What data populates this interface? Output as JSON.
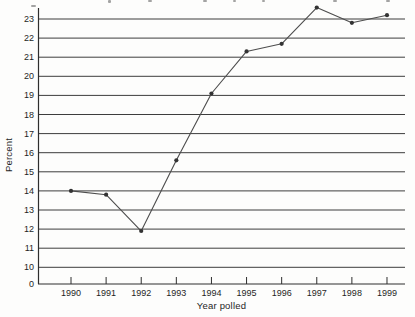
{
  "chart_data": {
    "type": "line",
    "title": "",
    "xlabel": "Year polled",
    "ylabel": "Percent",
    "categories": [
      1990,
      1991,
      1992,
      1993,
      1994,
      1995,
      1996,
      1997,
      1998,
      1999
    ],
    "series": [
      {
        "name": "Percent by year",
        "values": [
          14.0,
          13.8,
          11.9,
          15.6,
          19.1,
          21.3,
          21.7,
          23.6,
          22.8,
          23.2
        ]
      }
    ],
    "y_ticks": [
      23,
      22,
      21,
      20,
      19,
      18,
      17,
      16,
      15,
      14,
      13,
      12,
      11,
      10
    ],
    "y_axis_bottom_label": "0",
    "ylim": [
      10,
      24
    ],
    "axis_break": true,
    "grid": true,
    "legend": "none",
    "colors": {
      "line": "#4d4d4d",
      "marker": "#333333",
      "grid": "#3d3d3d",
      "axis": "#2e2e2e",
      "text": "#1f1f1f",
      "background": "#fdfdfc"
    }
  }
}
